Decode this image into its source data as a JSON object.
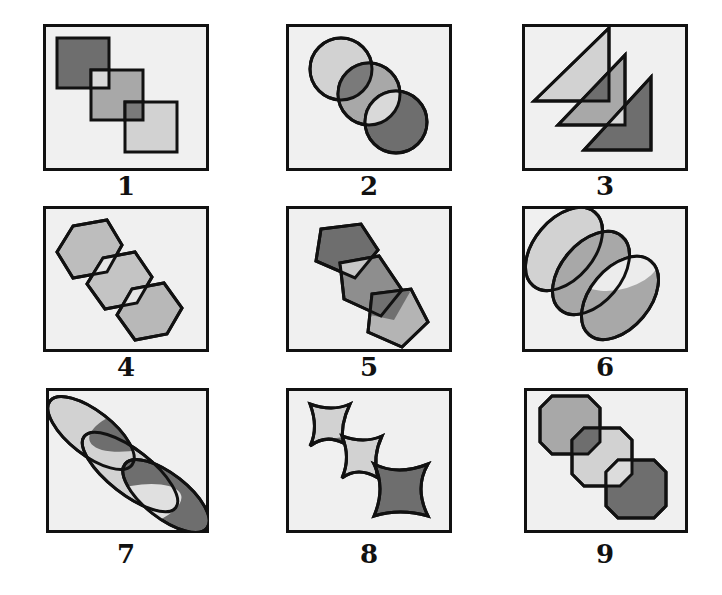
{
  "figure": {
    "colors": {
      "frame_bg": "#f0f0f0",
      "stroke": "#111111",
      "light": "#d2d2d2",
      "mid": "#a8a8a8",
      "dark": "#6e6e6e",
      "overlap_light": "#e2e2e2"
    },
    "panels": [
      {
        "label": "1",
        "shape": "square",
        "fills": [
          "dark",
          "mid",
          "light"
        ],
        "overlaps": [
          "light",
          "dark"
        ]
      },
      {
        "label": "2",
        "shape": "circle",
        "fills": [
          "light",
          "mid",
          "dark"
        ],
        "overlaps": [
          "dark",
          "light"
        ]
      },
      {
        "label": "3",
        "shape": "right-triangle",
        "fills": [
          "light",
          "mid",
          "dark"
        ],
        "overlaps": [
          "dark",
          "light"
        ]
      },
      {
        "label": "4",
        "shape": "hexagon",
        "fills": [
          "mid",
          "mid",
          "mid"
        ],
        "overlaps": [
          "light",
          "light"
        ]
      },
      {
        "label": "5",
        "shape": "pentagon",
        "fills": [
          "dark",
          "mid",
          "light"
        ],
        "overlaps": [
          "light",
          "dark"
        ]
      },
      {
        "label": "6",
        "shape": "ellipse",
        "fills": [
          "light",
          "mid",
          "mid"
        ],
        "overlaps": [
          "mid",
          "light"
        ]
      },
      {
        "label": "7",
        "shape": "elongated-ellipse",
        "fills": [
          "light",
          "light",
          "dark"
        ],
        "overlaps": [
          "dark",
          "light"
        ]
      },
      {
        "label": "8",
        "shape": "four-point-star",
        "fills": [
          "light",
          "light",
          "dark"
        ],
        "overlaps": [
          "dark",
          "light"
        ]
      },
      {
        "label": "9",
        "shape": "octagon",
        "fills": [
          "mid",
          "light",
          "dark"
        ],
        "overlaps": [
          "dark",
          "light"
        ]
      }
    ]
  }
}
